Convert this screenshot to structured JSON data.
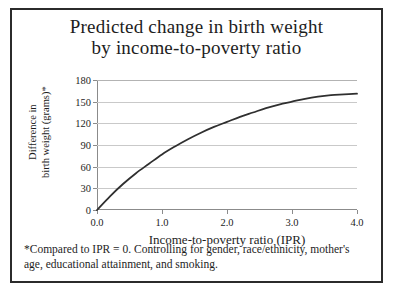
{
  "figure": {
    "border_color": "#2b2b2b",
    "background": "#ffffff"
  },
  "title": {
    "line1": "Predicted change in birth weight",
    "line2": "by income-to-poverty ratio"
  },
  "footnote": {
    "text": "*Compared to IPR = 0. Controlling for gender, race/ethnicity, mother's age, educational attainment, and smoking."
  },
  "chart_data": {
    "type": "line",
    "title": "Predicted change in birth weight by income-to-poverty ratio",
    "xlabel": "Income-to-poverty ratio (IPR)",
    "ylabel_line1": "Difference in",
    "ylabel_line2": "birth weight (grams)*",
    "ylabel": "Difference in birth weight (grams)*",
    "xlim": [
      0.0,
      4.0
    ],
    "ylim": [
      0,
      180
    ],
    "xticks": [
      0.0,
      1.0,
      2.0,
      3.0,
      4.0
    ],
    "xtick_labels": [
      "0.0",
      "1.0",
      "2.0",
      "3.0",
      "4.0"
    ],
    "yticks": [
      0,
      30,
      60,
      90,
      120,
      150,
      180
    ],
    "ytick_labels": [
      "0",
      "30",
      "60",
      "90",
      "120",
      "150",
      "180"
    ],
    "grid": "horizontal",
    "grid_color": "#c9c9c9",
    "legend": "none",
    "line_color": "#2f2f2f",
    "line_width": 1.8,
    "x": [
      0.0,
      0.2,
      0.4,
      0.6,
      0.8,
      1.0,
      1.2,
      1.4,
      1.6,
      1.8,
      2.0,
      2.2,
      2.4,
      2.6,
      2.8,
      3.0,
      3.2,
      3.4,
      3.6,
      3.8,
      4.0
    ],
    "values": [
      0,
      19,
      36,
      51,
      64,
      77,
      88,
      98,
      107,
      115,
      122,
      129,
      135,
      141,
      146,
      150,
      154,
      157,
      159,
      160,
      161
    ]
  }
}
